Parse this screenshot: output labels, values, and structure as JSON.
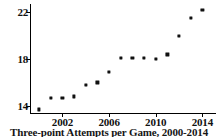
{
  "figure": {
    "caption": "Three-point Attempts per Game, 2000-2014"
  },
  "chart_data": {
    "type": "scatter",
    "title": "Three-point Attempts per Game, 2000-2014",
    "xlabel": "",
    "ylabel": "",
    "xlim": [
      1999.3,
      2015.0
    ],
    "ylim": [
      13.3,
      22.7
    ],
    "grid": false,
    "legend": null,
    "x_ticks": [
      2002,
      2006,
      2010,
      2014
    ],
    "x_tick_labels": [
      "2002",
      "2006",
      "2010",
      "2014"
    ],
    "y_ticks": [
      14,
      18,
      22
    ],
    "y_tick_labels": [
      "14",
      "18",
      "22"
    ],
    "marker": "square",
    "marker_color": "#111111",
    "x": [
      2000,
      2001,
      2002,
      2003,
      2004,
      2005,
      2006,
      2007,
      2008,
      2009,
      2010,
      2011,
      2012,
      2013,
      2014
    ],
    "values": [
      13.7,
      14.7,
      14.7,
      14.8,
      15.8,
      16.0,
      16.9,
      18.1,
      18.1,
      18.1,
      18.0,
      18.4,
      20.0,
      21.5,
      22.2
    ],
    "points": [
      {
        "x": 2000,
        "y": 13.7
      },
      {
        "x": 2001,
        "y": 14.7
      },
      {
        "x": 2002,
        "y": 14.7
      },
      {
        "x": 2003,
        "y": 14.8
      },
      {
        "x": 2004,
        "y": 15.8
      },
      {
        "x": 2005,
        "y": 16.0
      },
      {
        "x": 2006,
        "y": 16.9
      },
      {
        "x": 2007,
        "y": 18.1
      },
      {
        "x": 2008,
        "y": 18.1
      },
      {
        "x": 2009,
        "y": 18.1
      },
      {
        "x": 2010,
        "y": 18.0
      },
      {
        "x": 2011,
        "y": 18.4
      },
      {
        "x": 2012,
        "y": 20.0
      },
      {
        "x": 2013,
        "y": 21.5
      },
      {
        "x": 2014,
        "y": 22.2
      }
    ]
  }
}
